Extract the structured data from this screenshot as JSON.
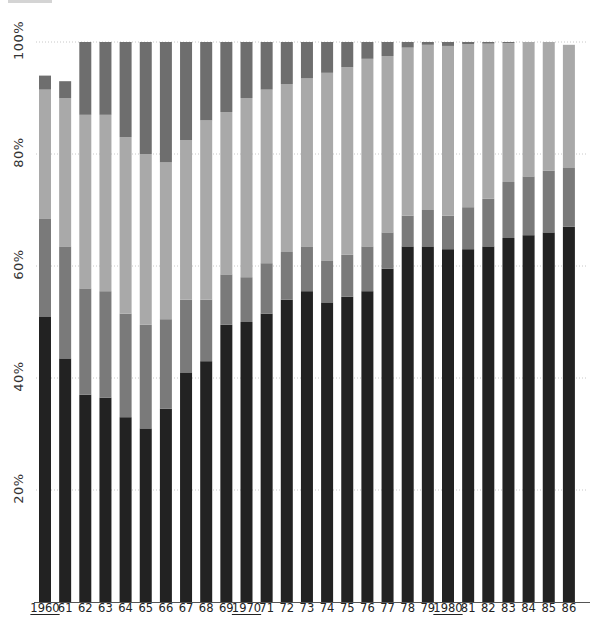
{
  "chart_data": {
    "type": "bar",
    "stacked": true,
    "title": "",
    "xlabel": "",
    "ylabel": "",
    "ylim": [
      0,
      100
    ],
    "y_ticks": [
      "20%",
      "40%",
      "60%",
      "80%",
      "100%"
    ],
    "grid": "horizontal dotted",
    "legend": "none",
    "categories": [
      "1960",
      "61",
      "62",
      "63",
      "64",
      "65",
      "66",
      "67",
      "68",
      "69",
      "1970",
      "71",
      "72",
      "73",
      "74",
      "75",
      "76",
      "77",
      "78",
      "79",
      "1980",
      "81",
      "82",
      "83",
      "84",
      "85",
      "86"
    ],
    "underlined_categories": [
      "1960",
      "1970",
      "1980"
    ],
    "series": [
      {
        "name": "segment-1 (black, bottom)",
        "color": "#222222",
        "values": [
          51,
          43.5,
          37,
          36.5,
          33,
          31,
          34.5,
          41,
          43,
          49.5,
          50,
          51.5,
          54,
          55.5,
          53.5,
          54.5,
          55.5,
          59.5,
          63.5,
          63.5,
          63,
          63,
          63.5,
          65,
          65.5,
          66,
          67
        ]
      },
      {
        "name": "segment-2 (mid gray)",
        "color": "#7a7a7a",
        "values": [
          17.5,
          20,
          19,
          19,
          18.5,
          18.5,
          16,
          13,
          11,
          9,
          8,
          9,
          8.5,
          8,
          7.5,
          7.5,
          8,
          6.5,
          5.5,
          6.5,
          6,
          7.5,
          8.5,
          10,
          10.5,
          11,
          10.5
        ]
      },
      {
        "name": "segment-3 (light gray)",
        "color": "#a9a9a9",
        "values": [
          23,
          26.5,
          31,
          31.5,
          31.5,
          30.5,
          28,
          28.5,
          32,
          29,
          32,
          31,
          30,
          30,
          33.5,
          33.5,
          33.5,
          31.5,
          30,
          29.5,
          30.3,
          29.1,
          27.7,
          24.8,
          24,
          23,
          22
        ]
      },
      {
        "name": "segment-4 (dark gray, top)",
        "color": "#6e6e6e",
        "values": [
          2.5,
          3,
          13,
          13,
          17,
          20,
          21.5,
          17.5,
          14,
          12.5,
          10,
          8.5,
          7.5,
          6.5,
          5.5,
          4.5,
          3,
          2.5,
          1,
          0.5,
          0.7,
          0.4,
          0.3,
          0.2,
          0,
          0,
          0
        ]
      }
    ]
  }
}
